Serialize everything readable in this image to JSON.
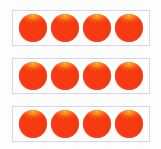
{
  "figure": {
    "title": "Dot Array",
    "background_color": "#fdfdfd"
  },
  "chart_data": {
    "type": "table",
    "title": "Dot Array",
    "xlabel": "",
    "ylabel": "",
    "rows": 3,
    "columns": 4,
    "total_dots": 12,
    "categories": [
      "Row 1",
      "Row 2",
      "Row 3"
    ],
    "values": [
      4,
      4,
      4
    ],
    "series": [
      {
        "name": "Dots per row",
        "values": [
          4,
          4,
          4
        ]
      }
    ],
    "grid": false,
    "legend": "none",
    "annotations": []
  },
  "style": {
    "dot_color": "#f93a10",
    "dot_highlight_color": "#ffc628",
    "frame_border_color": "#d8d8e4",
    "frame_fill_color": "#fefefe"
  },
  "rows": [
    {
      "row_label": "Row 1",
      "count": 4,
      "dots": [
        {
          "label": "Dot 1"
        },
        {
          "label": "Dot 2"
        },
        {
          "label": "Dot 3"
        },
        {
          "label": "Dot 4"
        }
      ]
    },
    {
      "row_label": "Row 2",
      "count": 4,
      "dots": [
        {
          "label": "Dot 1"
        },
        {
          "label": "Dot 2"
        },
        {
          "label": "Dot 3"
        },
        {
          "label": "Dot 4"
        }
      ]
    },
    {
      "row_label": "Row 3",
      "count": 4,
      "dots": [
        {
          "label": "Dot 1"
        },
        {
          "label": "Dot 2"
        },
        {
          "label": "Dot 3"
        },
        {
          "label": "Dot 4"
        }
      ]
    }
  ]
}
